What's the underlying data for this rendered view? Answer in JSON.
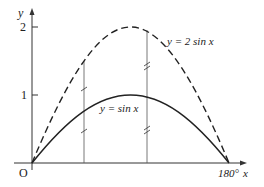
{
  "figure": {
    "y_axis_label": "y",
    "x_axis_label": "x",
    "origin_label": "O",
    "x_end_label": "180°",
    "y_ticks": [
      {
        "label": "2",
        "value": 2
      },
      {
        "label": "1",
        "value": 1
      }
    ],
    "curves": [
      {
        "name": "y = 2 sin x",
        "label": "y = 2 sin x",
        "style": "dashed",
        "amplitude": 2
      },
      {
        "name": "y = sin x",
        "label": "y = sin x",
        "style": "solid",
        "amplitude": 1
      }
    ],
    "verticals": [
      {
        "x_deg": 45,
        "hatch": "single"
      },
      {
        "x_deg": 105,
        "hatch": "double"
      }
    ],
    "colors": {
      "ink": "#222222",
      "background": "#ffffff"
    }
  }
}
